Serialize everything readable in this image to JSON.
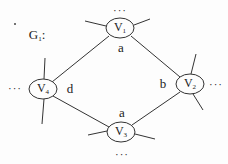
{
  "graph": {
    "title": "G",
    "title_sub": "1",
    "title_suffix": ":",
    "nodes": [
      {
        "id": "V1",
        "label": "V",
        "sub": "1",
        "x": 120,
        "y": 28
      },
      {
        "id": "V2",
        "label": "V",
        "sub": "2",
        "x": 190,
        "y": 84
      },
      {
        "id": "V3",
        "label": "V",
        "sub": "3",
        "x": 121,
        "y": 132
      },
      {
        "id": "V4",
        "label": "V",
        "sub": "4",
        "x": 43,
        "y": 89
      }
    ],
    "edges": [
      {
        "from": "V1",
        "to": "V4",
        "label": ""
      },
      {
        "from": "V1",
        "to": "V2",
        "label": ""
      },
      {
        "from": "V4",
        "to": "V3",
        "label": ""
      },
      {
        "from": "V3",
        "to": "V2",
        "label": ""
      }
    ],
    "edge_labels": {
      "v1_bottom": "a",
      "v4_right": "d",
      "v2_left": "b",
      "v3_top": "a"
    },
    "ellipsis": "···",
    "stroke_color": "#333333"
  }
}
